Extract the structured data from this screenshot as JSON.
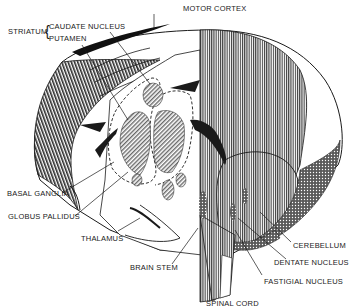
{
  "diagram": {
    "colors": {
      "ink": "#1a1a1a",
      "paper": "#ffffff",
      "hatch": "#555555",
      "shade": "#8a8a8a"
    },
    "labels": {
      "motor_cortex": "MOTOR CORTEX",
      "striatum": "STRIATUM",
      "striatum_brace": "{",
      "caudate_nucleus": "CAUDATE NUCLEUS",
      "putamen": "PUTAMEN",
      "basal_ganglia": "BASAL GANGLIA",
      "globus_pallidus": "GLOBUS PALLIDUS",
      "thalamus": "THALAMUS",
      "brain_stem": "BRAIN STEM",
      "spinal_cord": "SPINAL CORD",
      "cerebellum": "CEREBELLUM",
      "dentate_nucleus": "DENTATE NUCLEUS",
      "fastigial_nucleus": "FASTIGIAL NUCLEUS"
    }
  }
}
